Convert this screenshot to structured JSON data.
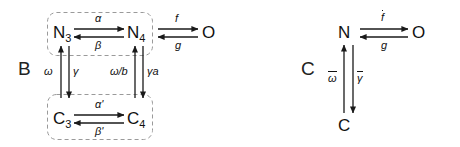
{
  "figure": {
    "panels": [
      {
        "id": "B",
        "letter": "B",
        "nodes": [
          {
            "name": "N3-node",
            "base": "N",
            "sub": "3"
          },
          {
            "name": "N4-node",
            "base": "N",
            "sub": "4"
          },
          {
            "name": "O-node",
            "base": "O",
            "sub": ""
          },
          {
            "name": "C3-node",
            "base": "C",
            "sub": "3"
          },
          {
            "name": "C4-node",
            "base": "C",
            "sub": "4"
          }
        ],
        "groups": [
          {
            "name": "open-states-group",
            "members": [
              "N3",
              "N4"
            ]
          },
          {
            "name": "closed-states-group",
            "members": [
              "C3",
              "C4"
            ]
          }
        ],
        "transitions": [
          {
            "name": "N3-to-N4",
            "label": "α",
            "from": "N3",
            "to": "N4",
            "direction": "right"
          },
          {
            "name": "N4-to-N3",
            "label": "β",
            "from": "N4",
            "to": "N3",
            "direction": "left"
          },
          {
            "name": "N4-to-O",
            "label": "f",
            "from": "N4",
            "to": "O",
            "direction": "right"
          },
          {
            "name": "O-to-N4",
            "label": "g",
            "from": "O",
            "to": "N4",
            "direction": "left"
          },
          {
            "name": "C3-to-N3",
            "label": "ω",
            "from": "C3",
            "to": "N3",
            "direction": "up"
          },
          {
            "name": "N3-to-C3",
            "label": "γ",
            "from": "N3",
            "to": "C3",
            "direction": "down"
          },
          {
            "name": "C4-to-N4",
            "label": "ω/b",
            "from": "C4",
            "to": "N4",
            "direction": "up"
          },
          {
            "name": "N4-to-C4",
            "label": "γa",
            "from": "N4",
            "to": "C4",
            "direction": "down"
          },
          {
            "name": "C3-to-C4",
            "label": "α'",
            "from": "C3",
            "to": "C4",
            "direction": "right"
          },
          {
            "name": "C4-to-C3",
            "label": "β'",
            "from": "C4",
            "to": "C3",
            "direction": "left"
          }
        ]
      },
      {
        "id": "C",
        "letter": "C",
        "nodes": [
          {
            "name": "N-node",
            "base": "N",
            "sub": ""
          },
          {
            "name": "O-node",
            "base": "O",
            "sub": ""
          },
          {
            "name": "C-node",
            "base": "C",
            "sub": ""
          }
        ],
        "groups": [],
        "transitions": [
          {
            "name": "N-to-O",
            "label": "f",
            "overbar": true,
            "from": "N",
            "to": "O",
            "direction": "right"
          },
          {
            "name": "O-to-N",
            "label": "g",
            "overbar": false,
            "from": "O",
            "to": "N",
            "direction": "left"
          },
          {
            "name": "C-to-N",
            "label": "ω",
            "overbar": true,
            "from": "C",
            "to": "N",
            "direction": "up"
          },
          {
            "name": "N-to-C",
            "label": "γ",
            "overbar": true,
            "from": "N",
            "to": "C",
            "direction": "down"
          }
        ]
      }
    ],
    "style": {
      "arrow_color": "#1a1a1a",
      "group_border_color": "#9a9a9a",
      "background": "#ffffff"
    }
  }
}
